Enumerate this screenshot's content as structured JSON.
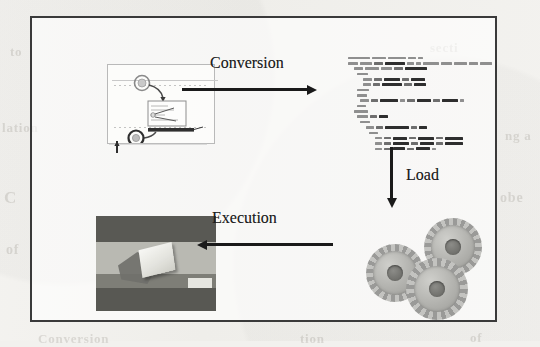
{
  "figure": {
    "kind": "pipeline-diagram",
    "frame": {
      "border_color": "#3a3a3a"
    },
    "page_background": "#f2f1ee"
  },
  "arrows": [
    {
      "id": "conversion",
      "label": "Conversion",
      "direction": "right"
    },
    {
      "id": "load",
      "label": "Load",
      "direction": "down"
    },
    {
      "id": "execution",
      "label": "Execution",
      "direction": "left"
    }
  ],
  "stages": {
    "model": {
      "name": "bpmn-process-model",
      "caption": "",
      "elements": [
        "start-event",
        "task",
        "end-event",
        "sequence-flow",
        "pool-lane"
      ]
    },
    "code": {
      "name": "xml-code-listing",
      "caption": "",
      "line_count": 22
    },
    "engine": {
      "name": "gears-engine",
      "caption": "",
      "gear_count": 3,
      "color": "#b2b2ae"
    },
    "result": {
      "name": "3d-render-result",
      "caption": "",
      "bands": [
        "#5a5a57",
        "#b8b8b3",
        "#6a6a66",
        "#5a5a57"
      ]
    }
  },
  "ghost_text": [
    {
      "text": "to",
      "x": 10,
      "y": 44,
      "size": 13,
      "rot": 0
    },
    {
      "text": "secti",
      "x": 430,
      "y": 40,
      "size": 13,
      "rot": 0
    },
    {
      "text": "lation",
      "x": 2,
      "y": 120,
      "size": 13,
      "rot": 0
    },
    {
      "text": "ng a",
      "x": 505,
      "y": 128,
      "size": 13,
      "rot": 0
    },
    {
      "text": "C",
      "x": 4,
      "y": 188,
      "size": 17,
      "rot": 0
    },
    {
      "text": "obe",
      "x": 500,
      "y": 190,
      "size": 14,
      "rot": 0
    },
    {
      "text": "of",
      "x": 6,
      "y": 242,
      "size": 14,
      "rot": 0
    },
    {
      "text": "Conversion",
      "x": 38,
      "y": 331,
      "size": 13,
      "rot": 0
    },
    {
      "text": "tion",
      "x": 300,
      "y": 331,
      "size": 13,
      "rot": 0
    },
    {
      "text": "of",
      "x": 470,
      "y": 330,
      "size": 13,
      "rot": 0
    }
  ],
  "code_lines": [
    {
      "indent": 0,
      "tokens": [
        [
          "t",
          22
        ],
        [
          "t",
          14
        ],
        [
          "t",
          18
        ],
        [
          "t",
          8
        ],
        [
          "t",
          5
        ]
      ]
    },
    {
      "indent": 0,
      "tokens": [
        [
          "t",
          10
        ],
        [
          "t",
          12
        ],
        [
          "a",
          9
        ],
        [
          "b",
          20
        ],
        [
          "t",
          7
        ],
        [
          "t",
          5
        ],
        [
          "t",
          16
        ],
        [
          "t",
          11
        ],
        [
          "t",
          13
        ],
        [
          "t",
          9
        ],
        [
          "t",
          12
        ]
      ]
    },
    {
      "indent": 2,
      "tokens": [
        [
          "t",
          9
        ],
        [
          "t",
          14
        ],
        [
          "t",
          11
        ],
        [
          "a",
          9
        ],
        [
          "b",
          22
        ]
      ]
    },
    {
      "indent": 3,
      "tokens": [
        [
          "t",
          11
        ]
      ]
    },
    {
      "indent": 5,
      "tokens": [
        [
          "t",
          9
        ],
        [
          "a",
          8
        ],
        [
          "b",
          16
        ],
        [
          "a",
          7
        ],
        [
          "b",
          14
        ]
      ]
    },
    {
      "indent": 5,
      "tokens": [
        [
          "t",
          8
        ],
        [
          "a",
          7
        ],
        [
          "b",
          20
        ],
        [
          "a",
          8
        ],
        [
          "b",
          12
        ]
      ]
    },
    {
      "indent": 3,
      "tokens": [
        [
          "t",
          12
        ]
      ]
    },
    {
      "indent": 3,
      "tokens": [
        [
          "t",
          10
        ]
      ]
    },
    {
      "indent": 4,
      "tokens": [
        [
          "t",
          9
        ],
        [
          "a",
          7
        ],
        [
          "b",
          18
        ],
        [
          "t",
          5
        ],
        [
          "a",
          8
        ],
        [
          "b",
          14
        ],
        [
          "a",
          7
        ],
        [
          "b",
          16
        ],
        [
          "t",
          4
        ]
      ]
    },
    {
      "indent": 3,
      "tokens": [
        [
          "t",
          9
        ]
      ]
    },
    {
      "indent": 2,
      "tokens": [
        [
          "t",
          14
        ]
      ]
    },
    {
      "indent": 3,
      "tokens": [
        [
          "t",
          11
        ],
        [
          "a",
          7
        ],
        [
          "b",
          9
        ]
      ]
    },
    {
      "indent": 4,
      "tokens": [
        [
          "t",
          10
        ]
      ]
    },
    {
      "indent": 6,
      "tokens": [
        [
          "t",
          8
        ],
        [
          "a",
          7
        ],
        [
          "b",
          24
        ],
        [
          "a",
          6
        ],
        [
          "b",
          8
        ]
      ]
    },
    {
      "indent": 7,
      "tokens": [
        [
          "t",
          9
        ]
      ]
    },
    {
      "indent": 9,
      "tokens": [
        [
          "t",
          7
        ],
        [
          "a",
          7
        ],
        [
          "b",
          14
        ],
        [
          "a",
          7
        ],
        [
          "b",
          16
        ],
        [
          "a",
          7
        ],
        [
          "b",
          18
        ]
      ]
    },
    {
      "indent": 9,
      "tokens": [
        [
          "t",
          7
        ],
        [
          "a",
          7
        ],
        [
          "b",
          16
        ],
        [
          "a",
          7
        ],
        [
          "b",
          14
        ],
        [
          "a",
          7
        ],
        [
          "b",
          18
        ]
      ]
    },
    {
      "indent": 9,
      "tokens": [
        [
          "t",
          7
        ],
        [
          "a",
          7
        ],
        [
          "b",
          12
        ],
        [
          "a",
          7
        ],
        [
          "b",
          14
        ],
        [
          "t",
          4
        ]
      ]
    },
    {
      "indent": 7,
      "tokens": [
        [
          "t",
          9
        ]
      ]
    },
    {
      "indent": 6,
      "tokens": [
        [
          "t",
          7
        ]
      ]
    },
    {
      "indent": 5,
      "tokens": [
        [
          "t",
          10
        ],
        [
          "a",
          7
        ],
        [
          "b",
          26
        ],
        [
          "a",
          5
        ],
        [
          "b",
          7
        ]
      ]
    },
    {
      "indent": 6,
      "tokens": [
        [
          "t",
          9
        ]
      ]
    },
    {
      "indent": 8,
      "tokens": [
        [
          "t",
          7
        ],
        [
          "a",
          7
        ],
        [
          "b",
          16
        ],
        [
          "a",
          7
        ],
        [
          "b",
          14
        ],
        [
          "a",
          7
        ],
        [
          "b",
          18
        ]
      ]
    },
    {
      "indent": 8,
      "tokens": [
        [
          "t",
          7
        ],
        [
          "a",
          7
        ],
        [
          "b",
          14
        ],
        [
          "a",
          7
        ],
        [
          "b",
          16
        ],
        [
          "a",
          7
        ],
        [
          "b",
          22
        ]
      ]
    }
  ]
}
